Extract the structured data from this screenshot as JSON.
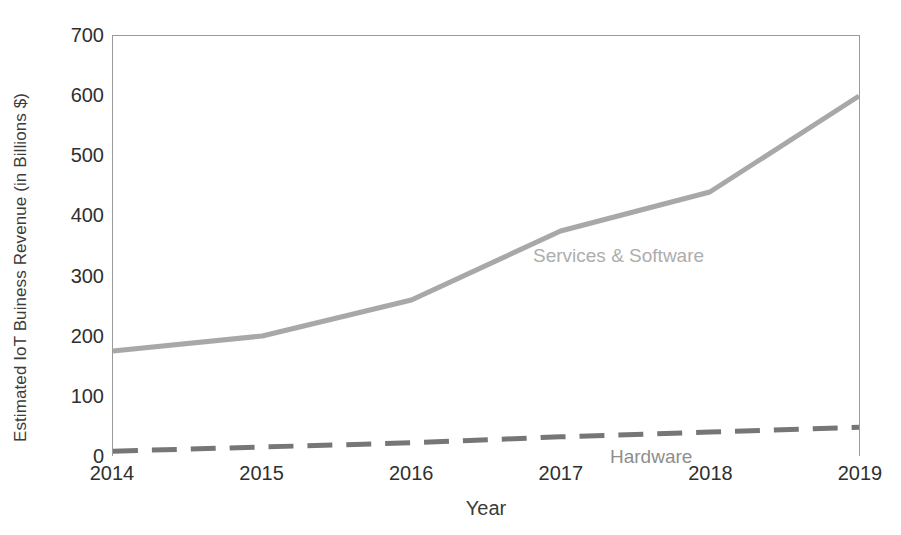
{
  "chart_data": {
    "type": "line",
    "title": "",
    "xlabel": "Year",
    "ylabel": "Estimated IoT Buiness Revenue (in Billions $)",
    "categories": [
      "2014",
      "2015",
      "2016",
      "2017",
      "2018",
      "2019"
    ],
    "x": [
      2014,
      2015,
      2016,
      2017,
      2018,
      2019
    ],
    "xlim": [
      2014,
      2019
    ],
    "ylim": [
      0,
      700
    ],
    "y_ticks": [
      0,
      100,
      200,
      300,
      400,
      500,
      600,
      700
    ],
    "y_tick_labels": [
      "0",
      "100",
      "200",
      "300",
      "400",
      "500",
      "600",
      "700"
    ],
    "grid": false,
    "legend_position": "inline-data-labels",
    "series": [
      {
        "name": "Services & Software",
        "values": [
          175,
          200,
          260,
          375,
          440,
          600
        ],
        "color": "#a8a8a8",
        "line_style": "solid",
        "line_width": 5,
        "label_text": "Services & Software",
        "label_color": "#adadad"
      },
      {
        "name": "Hardware",
        "values": [
          8,
          15,
          22,
          32,
          40,
          48
        ],
        "color": "#767676",
        "line_style": "dashed",
        "line_width": 5,
        "label_text": "Hardware",
        "label_color": "#8e8e8e"
      }
    ],
    "axis_frame": {
      "left": true,
      "top": true,
      "right": true,
      "bottom": false,
      "color": "#9a9a9a"
    },
    "background_color": "#ffffff"
  }
}
